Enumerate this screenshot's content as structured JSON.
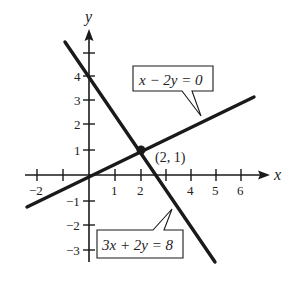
{
  "figure": {
    "x_axis_label": "x",
    "y_axis_label": "y",
    "x_ticks": [
      {
        "value": -2,
        "label": "−2"
      },
      {
        "value": -1,
        "label": ""
      },
      {
        "value": 1,
        "label": "1"
      },
      {
        "value": 2,
        "label": "2"
      },
      {
        "value": 3,
        "label": ""
      },
      {
        "value": 4,
        "label": "4"
      },
      {
        "value": 5,
        "label": "5"
      },
      {
        "value": 6,
        "label": "6"
      }
    ],
    "y_ticks": [
      {
        "value": 5,
        "label": ""
      },
      {
        "value": 4,
        "label": "4"
      },
      {
        "value": 3,
        "label": "3"
      },
      {
        "value": 2,
        "label": "2"
      },
      {
        "value": 1,
        "label": "1"
      },
      {
        "value": -1,
        "label": "−1"
      },
      {
        "value": -2,
        "label": "−2"
      },
      {
        "value": -3,
        "label": "−3"
      }
    ],
    "lines": [
      {
        "name": "line-x-minus-2y",
        "equation": "x − 2y = 0",
        "from": [
          -2.4,
          -1.2
        ],
        "to": [
          6.4,
          3.2
        ]
      },
      {
        "name": "line-3x-plus-2y",
        "equation": "3x + 2y = 8",
        "from": [
          -0.9,
          5.3
        ],
        "to": [
          4.9,
          -3.5
        ]
      }
    ],
    "intersection": {
      "x": 2,
      "y": 1,
      "label": "(2, 1)"
    },
    "labels": {
      "line1": "x − 2y = 0",
      "line2": "3x + 2y = 8",
      "point": "(2, 1)"
    },
    "colors": {
      "ink": "#1a1a1a",
      "background": "#ffffff"
    }
  }
}
